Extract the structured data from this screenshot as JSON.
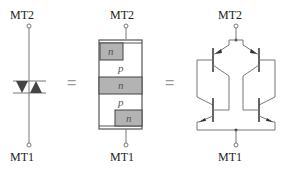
{
  "diagram": {
    "panels": [
      {
        "name": "triac-symbol",
        "top_label": "MT2",
        "bottom_label": "MT1"
      },
      {
        "name": "layer-structure",
        "top_label": "MT2",
        "bottom_label": "MT1",
        "layers": [
          "n",
          "p",
          "n",
          "p",
          "n"
        ]
      },
      {
        "name": "transistor-equivalent",
        "top_label": "MT2",
        "bottom_label": "MT1"
      }
    ],
    "equals": [
      "=",
      "="
    ]
  },
  "colors": {
    "line": "#777777",
    "n_fill": "#b3b3b3",
    "triangle": "#444444",
    "equals": "#999999"
  }
}
